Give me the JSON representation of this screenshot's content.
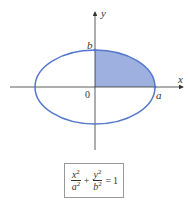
{
  "figure": {
    "axes": {
      "x_label": "x",
      "y_label": "y",
      "origin_label": "0"
    },
    "points": {
      "a_label": "a",
      "b_label": "b"
    },
    "equation": {
      "term1_num": "x",
      "term1_den": "a",
      "term2_num": "y",
      "term2_den": "b",
      "exponent": "2",
      "plus": "+",
      "equals": "=",
      "rhs": "1"
    },
    "colors": {
      "ellipse": "#5577cc",
      "shading": "#9db0e0",
      "axis": "#333333"
    }
  }
}
